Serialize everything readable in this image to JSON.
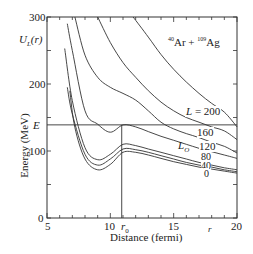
{
  "chart_data": {
    "type": "line",
    "title": "40Ar + 109Ag",
    "reaction": {
      "a_mass": "40",
      "a_sym": "Ar",
      "b_mass": "109",
      "b_sym": "Ag",
      "plus": "+"
    },
    "xlabel": "Distance (fermi)",
    "ylabel": "Energy (MeV)",
    "xlim": [
      5,
      20
    ],
    "ylim": [
      0,
      300
    ],
    "xticks": [
      "5",
      "10",
      "15",
      "20"
    ],
    "yticks": [
      "0",
      "100",
      "200",
      "300"
    ],
    "annotations": {
      "potential": "U",
      "potential_sub": "L",
      "potential_arg": "(r)",
      "energy": "E",
      "energy_value_mev": 139,
      "r0": "r",
      "r0_sub": "0",
      "r0_value_fermi": 10.9,
      "r_axis": "r",
      "L0": "L",
      "L0_sub": "O"
    },
    "series": [
      {
        "name": "L = 200",
        "label": "L = 200",
        "x": [
          11.8,
          13,
          14,
          15,
          16,
          17,
          18,
          19,
          20
        ],
        "y": [
          300,
          270,
          244,
          222,
          203,
          186,
          171,
          158,
          136
        ]
      },
      {
        "name": "L = 160",
        "label": "160",
        "x": [
          9.0,
          10,
          11,
          12,
          13,
          14,
          15,
          16,
          17,
          18,
          19,
          20
        ],
        "y": [
          300,
          262,
          232,
          210,
          190,
          173,
          160,
          150,
          143,
          136,
          130,
          117
        ]
      },
      {
        "name": "L = 120",
        "label": "120",
        "x": [
          7.2,
          8,
          9,
          10,
          11,
          12,
          13,
          14,
          15,
          16,
          17,
          18,
          19,
          20
        ],
        "y": [
          300,
          243,
          210,
          195,
          186,
          176,
          160,
          143,
          133,
          126,
          120,
          113,
          107,
          97
        ]
      },
      {
        "name": "L0",
        "label": "L0",
        "x": [
          6.6,
          7,
          8,
          9,
          10,
          11,
          12,
          13,
          14,
          15,
          16,
          17,
          18,
          19,
          20
        ],
        "y": [
          290,
          250,
          160,
          140,
          128,
          139,
          136,
          129,
          122,
          116,
          110,
          104,
          99,
          94,
          89
        ]
      },
      {
        "name": "L = 80",
        "label": "80",
        "x": [
          6.4,
          7,
          8,
          9,
          10,
          11,
          12,
          13,
          14,
          15,
          16,
          17,
          18,
          19,
          20
        ],
        "y": [
          253,
          175,
          105,
          87,
          95,
          110,
          108,
          103,
          98,
          93,
          88,
          83,
          79,
          75,
          72
        ]
      },
      {
        "name": "L = 40",
        "label": "40",
        "x": [
          6.6,
          7,
          8,
          9,
          10,
          11,
          12,
          13,
          14,
          15,
          16,
          17,
          18,
          19,
          20
        ],
        "y": [
          195,
          155,
          95,
          79,
          88,
          103,
          102,
          98,
          93,
          88,
          83,
          79,
          76,
          72,
          69
        ]
      },
      {
        "name": "L = 0",
        "label": "0",
        "x": [
          6.8,
          7.2,
          8,
          9,
          10,
          11,
          12,
          13,
          14,
          15,
          16,
          17,
          18,
          19,
          20
        ],
        "y": [
          190,
          135,
          88,
          72,
          80,
          98,
          98,
          94,
          89,
          84,
          80,
          76,
          73,
          70,
          67
        ]
      }
    ],
    "grid": false,
    "legend": "inline labels"
  }
}
